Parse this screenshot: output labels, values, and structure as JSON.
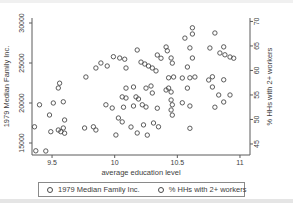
{
  "figure": {
    "background": "#ffffff",
    "axis_color": "#5a5a5a",
    "text_color": "#3d3d3d",
    "marker_color": "#4a4a4a"
  },
  "chart_data": {
    "type": "scatter",
    "title": "",
    "xlabel": "average education level",
    "ylabel_left": "1979 Median Family Inc.",
    "ylabel_right": "% HHs with 2+ workers",
    "grid": false,
    "marker": "hollow-circle",
    "legend_position": "bottom",
    "legend": [
      "1979 Median Family Inc.",
      "% HHs with 2+ workers"
    ],
    "x_ticks": [
      9.5,
      10,
      10.5,
      11
    ],
    "x_tick_labels": [
      "9.5",
      "10",
      "10.5",
      "11"
    ],
    "y_left_ticks": [
      15000,
      20000,
      25000,
      30000
    ],
    "y_left_tick_labels": [
      "15000",
      "20000",
      "25000",
      "30000"
    ],
    "y_right_ticks": [
      45,
      50,
      55,
      60,
      65,
      70
    ],
    "y_right_tick_labels": [
      "45",
      "50",
      "55",
      "60",
      "65",
      "70"
    ],
    "layout": {
      "plot": {
        "left": 32,
        "top": 18,
        "right": 250,
        "bottom": 155
      },
      "xlim": [
        9.34,
        11.08
      ],
      "ylim_left": [
        13500,
        30625
      ],
      "ylim_right": [
        42.75,
        70.7
      ],
      "tick_len": 3
    },
    "series": [
      {
        "name": "1979 Median Family Inc.",
        "axis": "left",
        "points": [
          [
            9.77,
            23250
          ],
          [
            9.89,
            25000
          ],
          [
            9.94,
            24625
          ],
          [
            10.04,
            25625
          ],
          [
            10.18,
            26625
          ],
          [
            10.24,
            24875
          ],
          [
            10.3,
            24375
          ],
          [
            10.34,
            26000
          ],
          [
            10.41,
            27000
          ],
          [
            10.45,
            25625
          ],
          [
            10.47,
            23250
          ],
          [
            10.09,
            24375
          ],
          [
            10.62,
            28625
          ],
          [
            10.8,
            28750
          ],
          [
            10.76,
            26875
          ],
          [
            10.84,
            26250
          ],
          [
            10.92,
            25750
          ],
          [
            10.62,
            25625
          ],
          [
            10.54,
            23125
          ],
          [
            10.64,
            23250
          ],
          [
            10.75,
            22875
          ],
          [
            9.55,
            21875
          ],
          [
            9.51,
            20000
          ],
          [
            9.48,
            18500
          ],
          [
            9.6,
            17875
          ],
          [
            9.55,
            16625
          ],
          [
            9.59,
            16875
          ],
          [
            9.76,
            16875
          ],
          [
            9.85,
            16625
          ],
          [
            9.45,
            14000
          ],
          [
            10.15,
            22000
          ],
          [
            10.29,
            22125
          ],
          [
            10.09,
            20625
          ],
          [
            10.19,
            20500
          ],
          [
            10.41,
            21625
          ],
          [
            10.45,
            21375
          ],
          [
            9.98,
            19375
          ],
          [
            10.15,
            19625
          ],
          [
            10.25,
            19500
          ],
          [
            10.45,
            20375
          ],
          [
            10.45,
            19125
          ],
          [
            10.03,
            18125
          ],
          [
            10.13,
            17000
          ],
          [
            10.31,
            17500
          ],
          [
            10.18,
            16250
          ],
          [
            10.01,
            16000
          ],
          [
            10.78,
            22000
          ],
          [
            10.92,
            21000
          ],
          [
            10.6,
            19625
          ],
          [
            10.87,
            20125
          ]
        ]
      },
      {
        "name": "% HHs with 2+ workers",
        "axis": "right",
        "points": [
          [
            9.85,
            60.5
          ],
          [
            9.56,
            57.4
          ],
          [
            9.99,
            62.8
          ],
          [
            10.08,
            62.3
          ],
          [
            10.21,
            61.7
          ],
          [
            10.27,
            60.9
          ],
          [
            10.33,
            59.9
          ],
          [
            10.37,
            62.5
          ],
          [
            10.42,
            64.0
          ],
          [
            10.46,
            61.5
          ],
          [
            10.43,
            58.5
          ],
          [
            10.62,
            68.7
          ],
          [
            10.56,
            66.6
          ],
          [
            10.6,
            64.6
          ],
          [
            10.87,
            64.8
          ],
          [
            10.88,
            63.2
          ],
          [
            10.95,
            62.5
          ],
          [
            10.58,
            60.7
          ],
          [
            10.6,
            58.5
          ],
          [
            10.78,
            58.7
          ],
          [
            10.87,
            58.1
          ],
          [
            9.4,
            53.0
          ],
          [
            9.59,
            53.6
          ],
          [
            9.36,
            48.5
          ],
          [
            9.49,
            47.5
          ],
          [
            9.57,
            47.5
          ],
          [
            9.6,
            47.2
          ],
          [
            9.83,
            48.5
          ],
          [
            9.37,
            43.6
          ],
          [
            10.09,
            56.4
          ],
          [
            10.25,
            56.4
          ],
          [
            10.06,
            54.6
          ],
          [
            10.17,
            54.6
          ],
          [
            10.3,
            55.4
          ],
          [
            10.43,
            56.4
          ],
          [
            9.93,
            53.0
          ],
          [
            10.07,
            52.5
          ],
          [
            10.22,
            53.0
          ],
          [
            10.34,
            52.3
          ],
          [
            10.46,
            53.0
          ],
          [
            10.46,
            50.9
          ],
          [
            10.06,
            49.5
          ],
          [
            10.23,
            48.9
          ],
          [
            10.35,
            48.5
          ],
          [
            10.26,
            46.8
          ],
          [
            10.58,
            56.4
          ],
          [
            10.83,
            55.0
          ],
          [
            10.54,
            53.4
          ],
          [
            10.8,
            52.5
          ],
          [
            10.6,
            48.2
          ]
        ]
      }
    ]
  }
}
